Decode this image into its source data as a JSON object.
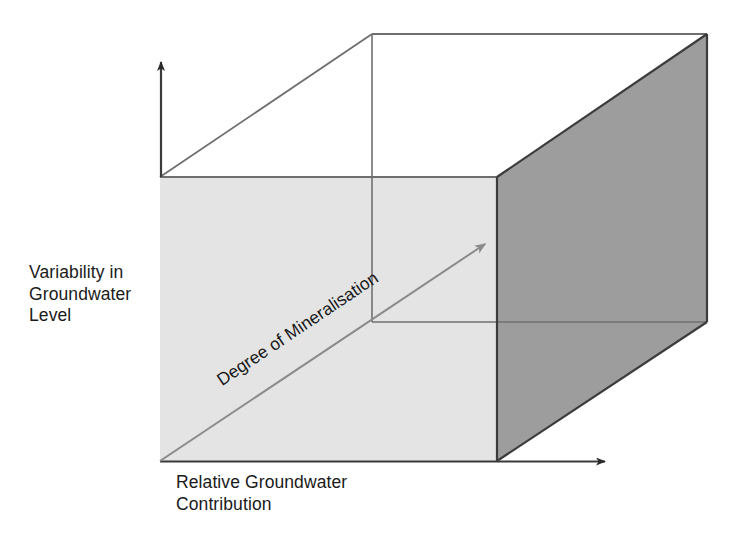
{
  "figure": {
    "type": "conceptual-3d-cube-diagram",
    "background_color": "#ffffff"
  },
  "axes": {
    "vertical": {
      "name": "variability-in-groundwater-level",
      "label": "Variability in\nGroundwater\nLevel",
      "arrow_direction": "up",
      "line_color": "#3a3a3a"
    },
    "horizontal": {
      "name": "relative-groundwater-contribution",
      "label": "Relative Groundwater\nContribution",
      "arrow_direction": "right",
      "line_color": "#3a3a3a"
    },
    "depth": {
      "name": "degree-of-mineralisation",
      "label": "Degree of Mineralisation",
      "arrow_direction": "up-right-diagonal",
      "line_color": "#8c8c8c",
      "rotation_degrees": -33.8
    }
  },
  "cube": {
    "front_face_color": "#e4e4e4",
    "right_face_color": "#9d9d9d",
    "top_face_color": "#ffffff",
    "edge_color": "#6e6e6e",
    "dark_edge_color": "#3c3c3c",
    "vertices": {
      "front_bottom_left": [
        160,
        461
      ],
      "front_top_left": [
        160,
        177
      ],
      "front_top_right": [
        497,
        177
      ],
      "front_bottom_right": [
        497,
        461
      ],
      "back_top_left": [
        372,
        34
      ],
      "back_top_right": [
        707,
        34
      ],
      "back_bottom_right": [
        707,
        322
      ],
      "interior_vertical_x": 372,
      "interior_horizontal_y": 322
    }
  }
}
